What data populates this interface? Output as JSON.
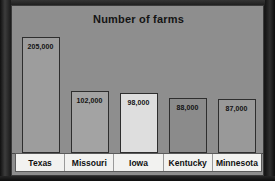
{
  "chart_data": {
    "type": "bar",
    "title": "Number of farms",
    "xlabel": "",
    "ylabel": "",
    "ylim": [
      0,
      220000
    ],
    "grid": false,
    "legend": "none",
    "categories": [
      "Texas",
      "Missouri",
      "Iowa",
      "Kentucky",
      "Minnesota"
    ],
    "values": [
      205000,
      102000,
      98000,
      88000,
      87000
    ],
    "value_labels": [
      "205,000",
      "102,000",
      "98,000",
      "88,000",
      "87,000"
    ],
    "bars": [
      {
        "category": "Texas",
        "value": 205000,
        "label": "205,000",
        "fill": "#9d9d9d"
      },
      {
        "category": "Missouri",
        "value": 102000,
        "label": "102,000",
        "fill": "#a3a3a3"
      },
      {
        "category": "Iowa",
        "value": 98000,
        "label": "98,000",
        "fill": "#dedede"
      },
      {
        "category": "Kentucky",
        "value": 88000,
        "label": "88,000",
        "fill": "#8b8b8b"
      },
      {
        "category": "Minnesota",
        "value": 87000,
        "label": "87,000",
        "fill": "#999999"
      }
    ]
  },
  "colors": {
    "plot_background": "#8e8e8e",
    "label_strip_background": "#f2f2f0",
    "bar_outline": "#2e2e2e",
    "text": "#121212",
    "page_frame": "#242424"
  }
}
